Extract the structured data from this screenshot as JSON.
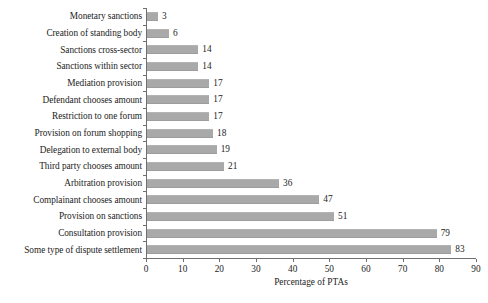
{
  "chart_data": {
    "type": "bar",
    "orientation": "horizontal",
    "title": "",
    "xlabel": "Percentage of PTAs",
    "ylabel": "",
    "xlim": [
      0,
      90
    ],
    "xticks": [
      0,
      10,
      20,
      30,
      40,
      50,
      60,
      70,
      80,
      90
    ],
    "grid": false,
    "legend": false,
    "bar_color": "#a9a9a9",
    "axis_color": "#6f6f6f",
    "text_color": "#1c1c1c",
    "background": "#ffffff",
    "show_value_labels": true,
    "categories": [
      "Monetary sanctions",
      "Creation of standing body",
      "Sanctions cross-sector",
      "Sanctions within sector",
      "Mediation provision",
      "Defendant chooses amount",
      "Restriction to one forum",
      "Provision on forum shopping",
      "Delegation to external body",
      "Third party chooses amount",
      "Arbitration provision",
      "Complainant chooses amount",
      "Provision on sanctions",
      "Consultation provision",
      "Some type of dispute settlement"
    ],
    "values": [
      3,
      6,
      14,
      14,
      17,
      17,
      17,
      18,
      19,
      21,
      36,
      47,
      51,
      79,
      83
    ]
  }
}
